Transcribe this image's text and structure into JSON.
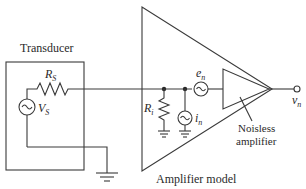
{
  "diagram": {
    "type": "circuit",
    "labels": {
      "transducer": "Transducer",
      "amplifier_model": "Amplifier model",
      "noiseless_line1": "Noisless",
      "noiseless_line2": "amplifier",
      "rs_main": "R",
      "rs_sub": "S",
      "vs_main": "V",
      "vs_sub": "S",
      "ri_main": "R",
      "ri_sub": "i",
      "en_main": "e",
      "en_sub": "n",
      "in_main": "i",
      "in_sub": "n",
      "vn_main": "v",
      "vn_sub": "n"
    },
    "components": [
      {
        "id": "RS",
        "kind": "resistor",
        "label": "R_S",
        "location": "transducer"
      },
      {
        "id": "VS",
        "kind": "ac-voltage-source",
        "label": "V_S",
        "location": "transducer"
      },
      {
        "id": "Ri",
        "kind": "resistor",
        "label": "R_i",
        "location": "amplifier-model",
        "connection": "node-to-ground"
      },
      {
        "id": "in",
        "kind": "ac-current-source",
        "label": "i_n",
        "location": "amplifier-model",
        "connection": "node-to-ground"
      },
      {
        "id": "en",
        "kind": "ac-voltage-source",
        "label": "e_n",
        "location": "amplifier-model",
        "connection": "series"
      },
      {
        "id": "amp",
        "kind": "amplifier",
        "label": "Noisless amplifier",
        "location": "amplifier-model"
      },
      {
        "id": "out",
        "kind": "output-terminal",
        "label": "v_n"
      }
    ],
    "colors": {
      "line": "#3a3a3a",
      "text": "#2a2a2a",
      "background": "#ffffff"
    }
  }
}
